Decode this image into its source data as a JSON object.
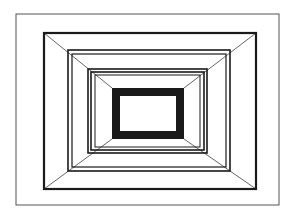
{
  "figure": {
    "width": 295,
    "height": 219,
    "background": "#ffffff",
    "stroke_color": "#1a1a1a",
    "thin_stroke_color": "#555555",
    "rectangles": [
      {
        "name": "outer-frame",
        "x": 16,
        "y": 14,
        "w": 263,
        "h": 191,
        "stroke": 1,
        "color": "#555555"
      },
      {
        "name": "frame-2",
        "x": 44,
        "y": 33,
        "w": 212,
        "h": 156,
        "stroke": 2.2,
        "color": "#1a1a1a"
      },
      {
        "name": "frame-3a",
        "x": 68,
        "y": 50,
        "w": 162,
        "h": 121,
        "stroke": 1.6,
        "color": "#1a1a1a"
      },
      {
        "name": "frame-3b",
        "x": 72,
        "y": 54,
        "w": 154,
        "h": 113,
        "stroke": 1.2,
        "color": "#1a1a1a"
      },
      {
        "name": "frame-4a",
        "x": 88,
        "y": 69,
        "w": 119,
        "h": 84,
        "stroke": 1.6,
        "color": "#1a1a1a"
      },
      {
        "name": "frame-4b",
        "x": 91,
        "y": 72,
        "w": 113,
        "h": 78,
        "stroke": 1.6,
        "color": "#1a1a1a"
      },
      {
        "name": "frame-4c",
        "x": 95,
        "y": 75,
        "w": 105,
        "h": 72,
        "stroke": 1.0,
        "color": "#1a1a1a"
      },
      {
        "name": "inner-thick-frame",
        "x": 116,
        "y": 92,
        "w": 64,
        "h": 43,
        "stroke": 8,
        "color": "#1a1a1a"
      }
    ],
    "diagonals": [
      {
        "name": "diagonal-top-left",
        "x1": 44,
        "y1": 33,
        "x2": 112,
        "y2": 88
      },
      {
        "name": "diagonal-top-right",
        "x1": 256,
        "y1": 33,
        "x2": 184,
        "y2": 88
      },
      {
        "name": "diagonal-bottom-left",
        "x1": 44,
        "y1": 189,
        "x2": 112,
        "y2": 139
      },
      {
        "name": "diagonal-bottom-right",
        "x1": 256,
        "y1": 189,
        "x2": 184,
        "y2": 139
      }
    ]
  }
}
